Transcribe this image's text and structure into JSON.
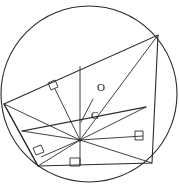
{
  "figure": {
    "stroke_color": "#2b2b2b",
    "background_color": "#ffffff",
    "width": 179,
    "height": 188
  },
  "circle": {
    "name": "circumscribed-circle",
    "center_x": 89,
    "center_y": 94,
    "radius": 88
  },
  "labels": [
    {
      "text": "O",
      "x": 97,
      "y": 91,
      "meaning": "circumcenter-label"
    },
    {
      "text": "G",
      "x": 91,
      "y": 119,
      "meaning": "centroid-label"
    }
  ],
  "points": {
    "hub": {
      "x": 80,
      "y": 140,
      "name": "central-hub-point"
    },
    "O": {
      "x": 93,
      "y": 99
    },
    "G": {
      "x": 83,
      "y": 117
    }
  },
  "polygon": {
    "name": "inscribed-polygon",
    "vertices": [
      {
        "x": 4,
        "y": 104,
        "name": "vertex-left"
      },
      {
        "x": 158,
        "y": 35,
        "name": "vertex-top-right"
      },
      {
        "x": 152,
        "y": 163,
        "name": "vertex-bottom-right"
      },
      {
        "x": 38,
        "y": 166,
        "name": "vertex-bottom-left"
      }
    ],
    "points_string": "4,104 158,35 152,163 38,166"
  },
  "inner_lines": {
    "name": "radiating-spokes",
    "segments": [
      {
        "x1": 80,
        "y1": 140,
        "x2": 4,
        "y2": 104,
        "name": "spoke-to-vertex-left"
      },
      {
        "x1": 80,
        "y1": 140,
        "x2": 158,
        "y2": 35,
        "name": "spoke-to-vertex-top-right"
      },
      {
        "x1": 80,
        "y1": 140,
        "x2": 152,
        "y2": 163,
        "name": "spoke-to-vertex-bottom-right"
      },
      {
        "x1": 80,
        "y1": 140,
        "x2": 38,
        "y2": 166,
        "name": "spoke-to-vertex-bottom-left"
      },
      {
        "x1": 80,
        "y1": 140,
        "x2": 55,
        "y2": 89,
        "name": "perpendicular-to-upper-left-side"
      },
      {
        "x1": 80,
        "y1": 140,
        "x2": 80,
        "y2": 66,
        "name": "perpendicular-vertical-upper"
      },
      {
        "x1": 80,
        "y1": 140,
        "x2": 80,
        "y2": 166,
        "name": "perpendicular-to-bottom-side"
      },
      {
        "x1": 80,
        "y1": 140,
        "x2": 143,
        "y2": 136,
        "name": "perpendicular-to-right-side"
      },
      {
        "x1": 80,
        "y1": 140,
        "x2": 41,
        "y2": 157,
        "name": "perpendicular-to-lower-left-side"
      },
      {
        "x1": 80,
        "y1": 140,
        "x2": 22,
        "y2": 131,
        "name": "chord-left-horizontal"
      },
      {
        "x1": 80,
        "y1": 140,
        "x2": 146,
        "y2": 107,
        "name": "chord-right-upper"
      }
    ]
  },
  "chords": {
    "name": "secondary-chords",
    "segments": [
      {
        "x1": 22,
        "y1": 131,
        "x2": 146,
        "y2": 107,
        "name": "chord-across-lower"
      },
      {
        "x1": 4,
        "y1": 104,
        "x2": 38,
        "y2": 166,
        "name": "chord-left-side"
      }
    ]
  },
  "og_segment": {
    "name": "segment-O-to-G",
    "x1": 93,
    "y1": 99,
    "x2": 81,
    "y2": 122
  },
  "right_angle_marks": [
    {
      "name": "right-angle-mark-upper-left",
      "points": "48,83 55,80 58,87 51,90",
      "cx": 53,
      "cy": 85
    },
    {
      "name": "right-angle-mark-lower-left",
      "points": "33,148 41,145 44,152 36,155",
      "cx": 38,
      "cy": 150
    },
    {
      "name": "right-angle-mark-bottom-center",
      "points": "70,158 80,158 80,166 70,166",
      "cx": 75,
      "cy": 162
    },
    {
      "name": "right-angle-mark-right",
      "points": "135,131 143,131 143,140 135,140",
      "cx": 139,
      "cy": 135
    }
  ]
}
